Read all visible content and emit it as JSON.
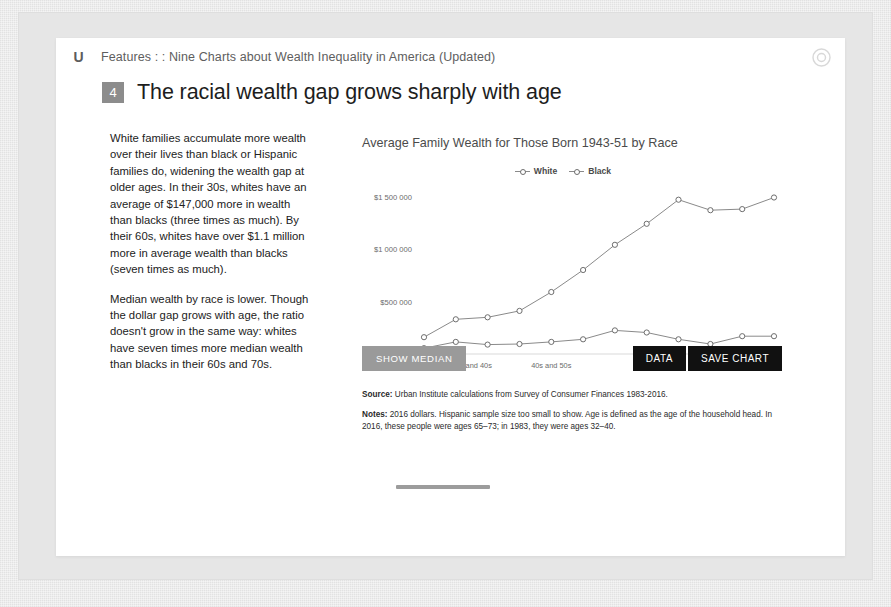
{
  "header": {
    "logo": "U",
    "breadcrumb": "Features : : Nine Charts about Wealth Inequality in America (Updated)",
    "share_icon": "share-circle-icon"
  },
  "title": {
    "number": "4",
    "text": "The racial wealth gap grows sharply with age"
  },
  "body_text": {
    "paragraph_1": "White families accumulate more wealth over their lives than black or Hispanic families do, widening the wealth gap at older ages. In their 30s, whites have an average of $147,000 more in wealth than blacks (three times as much). By their 60s, whites have over $1.1 million more in average wealth than blacks (seven times as much).",
    "paragraph_2": "Median wealth by race is lower. Though the dollar gap grows with age, the ratio doesn't grow in the same way: whites have seven times more median wealth than blacks in their 60s and 70s."
  },
  "buttons": {
    "show_median": "SHOW MEDIAN",
    "data": "DATA",
    "save_chart": "SAVE CHART"
  },
  "footnotes": {
    "source_label": "Source:",
    "source_text": " Urban Institute calculations from Survey of Consumer Finances 1983-2016.",
    "notes_label": "Notes:",
    "notes_text": " 2016 dollars. Hispanic sample size too small to show. Age is defined as the age of the household head. In 2016, these people were ages 65–73; in 1983, they were ages 32–40."
  },
  "colors": {
    "line": "#8a8a8a",
    "marker_stroke": "#6e6e6e",
    "axis": "#d6d6d6",
    "badge": "#8c8c8c",
    "btn_dark": "#111111",
    "btn_gray": "#9a9a9a"
  },
  "chart_data": {
    "type": "line",
    "title": "Average Family Wealth for Those Born 1943-51 by Race",
    "xlabel": "",
    "ylabel": "",
    "ylim": [
      0,
      1600000
    ],
    "yticks": [
      0,
      500000,
      1000000,
      1500000
    ],
    "ytick_labels": [
      "$0",
      "$500 000",
      "$1 000 000",
      "$1 500 000"
    ],
    "xtick_labels": [
      "30s and 40s",
      "40s and 50s",
      "50s and 60s",
      "60s and 70s"
    ],
    "xtick_indices": [
      1.5,
      4.0,
      7.3,
      9.0
    ],
    "grid": false,
    "legend_position": "top-center",
    "x": [
      1983,
      1986,
      1989,
      1992,
      1995,
      1998,
      2001,
      2004,
      2007,
      2010,
      2013,
      2016
    ],
    "series": [
      {
        "name": "White",
        "values": [
          160000,
          330000,
          350000,
          410000,
          590000,
          800000,
          1040000,
          1240000,
          1470000,
          1370000,
          1380000,
          1490000
        ]
      },
      {
        "name": "Black",
        "values": [
          55000,
          115000,
          90000,
          95000,
          115000,
          140000,
          225000,
          205000,
          140000,
          95000,
          170000,
          170000
        ]
      }
    ]
  }
}
